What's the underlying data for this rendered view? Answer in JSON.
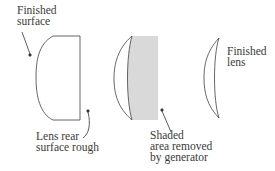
{
  "figure": {
    "type": "lens generating process diagram",
    "stages": [
      {
        "id": "blank",
        "description": "Lens blank with rough rear surface"
      },
      {
        "id": "generating",
        "description": "Material removed by generator (shaded)"
      },
      {
        "id": "finished",
        "description": "Finished meniscus lens"
      }
    ],
    "colors": {
      "stroke": "#555555",
      "shading": "#d9d9d9",
      "text": "#3a3a3a"
    }
  },
  "labels": {
    "finished_surface": "Finished\nsurface",
    "rear_surface": "Lens rear\nsurface rough",
    "shaded_area": "Shaded\narea removed\nby generator",
    "finished_lens": "Finished\nlens"
  }
}
